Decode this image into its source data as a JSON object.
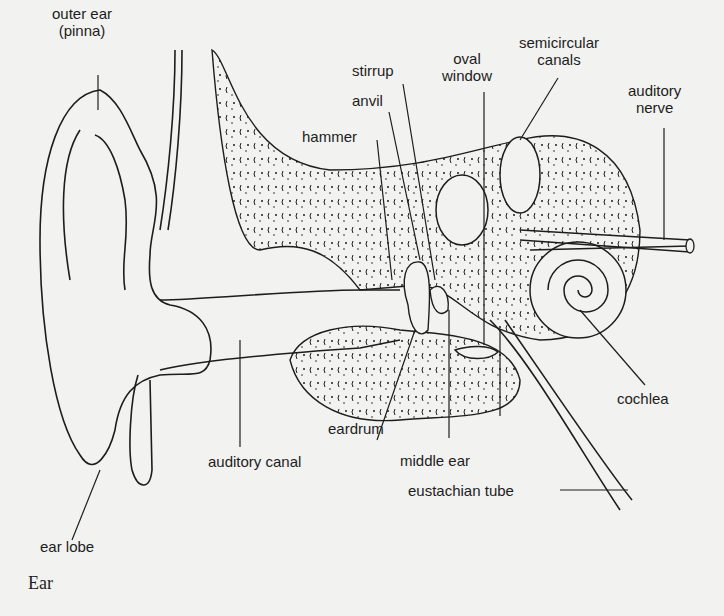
{
  "diagram": {
    "caption": "Ear",
    "labels": {
      "outer_ear": [
        "outer ear",
        "(pinna)"
      ],
      "stirrup": "stirrup",
      "anvil": "anvil",
      "hammer": "hammer",
      "oval_window": [
        "oval",
        "window"
      ],
      "semicircular_canals": [
        "semicircular",
        "canals"
      ],
      "auditory_nerve": [
        "auditory",
        "nerve"
      ],
      "cochlea": "cochlea",
      "eardrum": "eardrum",
      "middle_ear": "middle ear",
      "auditory_canal": "auditory canal",
      "eustachian_tube": "eustachian tube",
      "ear_lobe": "ear lobe"
    },
    "colors": {
      "background": "#f2f2f0",
      "ink": "#1d1d1d"
    }
  }
}
